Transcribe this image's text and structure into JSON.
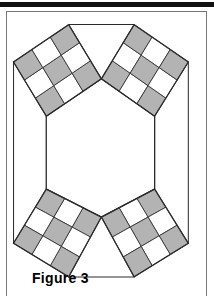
{
  "figure": {
    "caption": "Figure 3",
    "colors": {
      "shaded_cell": "#b3b3b3",
      "light_cell": "#ffffff",
      "outline": "#2b2b2b",
      "hexagon_fill": "#ffffff",
      "frame_border": "#777777",
      "top_bar": "#111111",
      "page_background": "#ffffff"
    },
    "geometry": {
      "hexagon_vertices": [
        [
          48,
          118
        ],
        [
          107,
          78
        ],
        [
          164,
          118
        ],
        [
          164,
          196
        ],
        [
          107,
          226
        ],
        [
          48,
          196
        ]
      ],
      "squares": [
        {
          "name": "top-left-square",
          "grid": 3,
          "corners": [
            [
              48,
              118
            ],
            [
              107,
              78
            ],
            [
              72,
              20
            ],
            [
              13,
              60
            ]
          ],
          "shaded_cells": [
            0,
            2,
            4,
            6,
            8
          ]
        },
        {
          "name": "top-right-square",
          "grid": 3,
          "corners": [
            [
              107,
              78
            ],
            [
              164,
              118
            ],
            [
              200,
              60
            ],
            [
              142,
              20
            ]
          ],
          "shaded_cells": [
            0,
            2,
            4,
            6,
            8
          ]
        },
        {
          "name": "bottom-left-square",
          "grid": 3,
          "corners": [
            [
              107,
              226
            ],
            [
              48,
              196
            ],
            [
              13,
              254
            ],
            [
              72,
              290
            ]
          ],
          "shaded_cells": [
            0,
            2,
            4,
            6,
            8
          ]
        },
        {
          "name": "bottom-right-square",
          "grid": 3,
          "corners": [
            [
              164,
              196
            ],
            [
              107,
              226
            ],
            [
              142,
              290
            ],
            [
              200,
              254
            ]
          ],
          "shaded_cells": [
            0,
            2,
            4,
            6,
            8
          ]
        }
      ],
      "connector_edges": [
        {
          "name": "top-edge",
          "from": [
            72,
            20
          ],
          "to": [
            142,
            20
          ]
        },
        {
          "name": "bottom-edge",
          "from": [
            72,
            290
          ],
          "to": [
            142,
            290
          ]
        },
        {
          "name": "left-edge",
          "from": [
            13,
            60
          ],
          "to": [
            13,
            254
          ]
        },
        {
          "name": "right-edge",
          "from": [
            200,
            60
          ],
          "to": [
            200,
            254
          ]
        }
      ]
    }
  }
}
